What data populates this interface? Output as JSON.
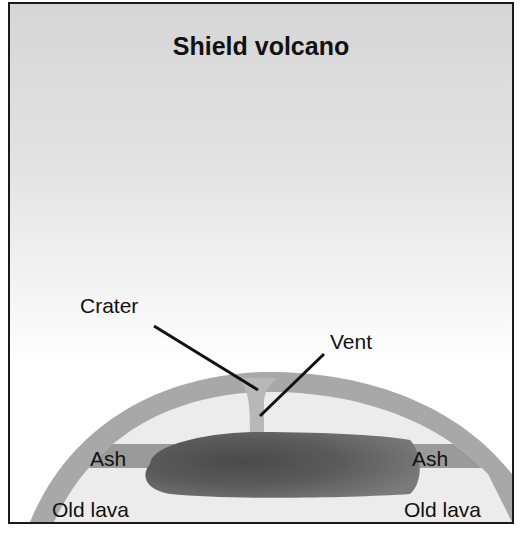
{
  "title": "Shield volcano",
  "labels": {
    "crater": "Crater",
    "vent": "Vent",
    "ash_left": "Ash",
    "ash_right": "Ash",
    "old_lava_left": "Old lava",
    "old_lava_right": "Old lava"
  },
  "colors": {
    "outer_layer": "#a8a8a8",
    "interior": "#ececec",
    "ash_band": "#9a9a9a",
    "magma_chamber": "#5e5e5e",
    "vent": "#b8b8b8",
    "leader_lines": "#111111",
    "border": "#1a1a1a"
  }
}
